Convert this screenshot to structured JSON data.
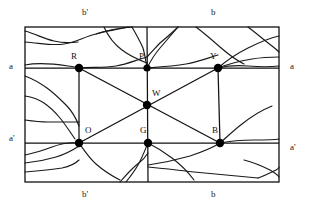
{
  "figure": {
    "colors": {
      "stroke": "#111111",
      "node_fill": "#000000",
      "background": "#ffffff",
      "crack_stroke": "#1a1a1a"
    },
    "rectangle": {
      "x": 25,
      "y": 27,
      "width": 254,
      "height": 155,
      "stroke_width": 1.3
    },
    "nodes": [
      {
        "id": "R",
        "label": "R",
        "x": 79,
        "y": 68,
        "r": 4.2,
        "label_x": 71,
        "label_y": 52
      },
      {
        "id": "P",
        "label": "P",
        "x": 147,
        "y": 68,
        "r": 3.6,
        "label_x": 139,
        "label_y": 52
      },
      {
        "id": "Y",
        "label": "Y",
        "x": 218,
        "y": 68,
        "r": 4.2,
        "label_x": 210,
        "label_y": 52
      },
      {
        "id": "W",
        "label": "W",
        "x": 147,
        "y": 105,
        "r": 4.2,
        "label_x": 152,
        "label_y": 89
      },
      {
        "id": "O",
        "label": "O",
        "x": 79,
        "y": 143,
        "r": 4.2,
        "label_x": 85,
        "label_y": 126
      },
      {
        "id": "G",
        "label": "G",
        "x": 148,
        "y": 143,
        "r": 4.2,
        "label_x": 140,
        "label_y": 126
      },
      {
        "id": "B",
        "label": "B",
        "x": 220,
        "y": 143,
        "r": 4.2,
        "label_x": 212,
        "label_y": 126
      }
    ],
    "straight_lines": [
      {
        "name": "horizontal-upper",
        "x1": 25,
        "y1": 68,
        "x2": 279,
        "y2": 68
      },
      {
        "name": "horizontal-lower",
        "x1": 25,
        "y1": 143,
        "x2": 279,
        "y2": 143
      },
      {
        "name": "vertical-left",
        "x1": 79,
        "y1": 68,
        "x2": 79,
        "y2": 143
      },
      {
        "name": "vertical-mid",
        "x1": 147,
        "y1": 27,
        "x2": 148,
        "y2": 182
      },
      {
        "name": "vertical-right",
        "x1": 218,
        "y1": 68,
        "x2": 220,
        "y2": 143
      },
      {
        "name": "diagonal-R-W-B",
        "x1": 79,
        "y1": 68,
        "x2": 220,
        "y2": 143
      },
      {
        "name": "diagonal-O-W-Y",
        "x1": 79,
        "y1": 143,
        "x2": 218,
        "y2": 68
      }
    ],
    "edge_labels": [
      {
        "id": "top-left",
        "text": "b'",
        "x": 82,
        "y": 8
      },
      {
        "id": "top-right",
        "text": "b",
        "x": 211,
        "y": 8
      },
      {
        "id": "left-upper",
        "text": "a",
        "x": 9,
        "y": 62
      },
      {
        "id": "left-lower",
        "text": "a'",
        "x": 9,
        "y": 134
      },
      {
        "id": "right-upper",
        "text": "a",
        "x": 290,
        "y": 62
      },
      {
        "id": "right-lower",
        "text": "a'",
        "x": 290,
        "y": 143
      },
      {
        "id": "bottom-left",
        "text": "b'",
        "x": 82,
        "y": 190
      },
      {
        "id": "bottom-right",
        "text": "b",
        "x": 211,
        "y": 190
      }
    ],
    "crack_paths": [
      "M25,42 C40,43 52,46 64,44 C76,42 84,37 96,34 C106,31 116,30 128,27",
      "M25,31 C36,34 44,39 54,41 C62,43 70,43 78,42",
      "M25,65 C40,62 55,64 68,66 C74,67 77,67 79,68",
      "M79,68 C92,67 104,68 116,66 C128,64 136,60 147,57",
      "M147,68 C150,62 154,55 160,48 C166,41 172,34 178,27",
      "M132,27 C136,34 140,41 143,48 C145,55 146,62 147,68",
      "M104,27 C108,36 114,44 122,50 C130,56 139,60 147,63",
      "M178,27 C172,33 166,38 160,43 C156,47 152,52 147,57",
      "M147,68 C160,67 174,66 186,64 C198,62 208,58 218,55",
      "M218,68 C226,66 236,65 248,66 C260,67 270,67 279,66",
      "M196,27 C204,33 212,40 220,47 C228,54 236,60 244,64",
      "M248,27 C256,33 264,40 272,46 C276,49 278,51 279,52",
      "M218,68 C226,61 236,54 248,48 C260,42 270,38 279,36",
      "M218,68 C228,64 240,61 252,59 C264,57 272,57 279,57",
      "M25,76 C33,79 40,83 47,88 C54,93 60,99 66,105 C72,111 76,118 79,126",
      "M25,96 C32,97 38,99 44,103 C50,107 55,112 60,118 C65,124 70,132 75,139",
      "M79,143 C84,150 89,158 96,164 C104,171 112,176 120,180",
      "M148,143 C145,150 142,158 138,165 C134,172 130,177 126,182",
      "M25,155 C35,153 44,150 52,147 C60,144 68,142 79,143",
      "M25,163 C36,162 46,160 56,157 C66,154 73,150 79,146",
      "M25,172 C38,171 50,170 62,168 C72,166 76,163 79,160",
      "M148,143 C156,147 164,152 172,158 C180,164 188,172 194,180",
      "M220,143 C227,137 234,130 242,124 C252,116 262,110 272,106",
      "M220,143 C230,141 242,140 254,140 C266,140 274,140 279,139",
      "M220,143 C212,148 202,152 190,156 C176,160 162,163 148,165",
      "M148,167 C160,168 176,170 194,172 C214,174 238,176 258,178",
      "M258,178 C264,176 270,173 276,170 C278,169 279,168 279,167",
      "M244,160 C252,162 262,166 270,170 C275,173 278,175 279,177",
      "M120,182 C126,175 132,168 140,162 C144,159 146,156 148,153",
      "M96,34 C108,30 120,28 132,27",
      "M25,120 C32,121 40,122 48,122 C58,122 70,122 79,122"
    ]
  }
}
